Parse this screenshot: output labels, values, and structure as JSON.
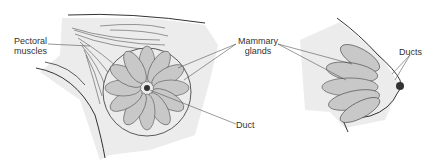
{
  "diagram": {
    "type": "anatomical illustration",
    "views": [
      {
        "name": "front view",
        "labels": [
          "Pectoral muscles",
          "Mammary glands",
          "Duct"
        ]
      },
      {
        "name": "side view",
        "labels": [
          "Mammary glands",
          "Ducts"
        ]
      }
    ]
  },
  "labels": {
    "pectoral_line1": "Pectoral",
    "pectoral_line2": "muscles",
    "mammary_line1": "Mammary",
    "mammary_line2": "glands",
    "duct": "Duct",
    "ducts": "Ducts"
  },
  "colors": {
    "skin": "#ececec",
    "lobe": "#c8c8c8",
    "outline": "#333333",
    "text": "#333333"
  }
}
